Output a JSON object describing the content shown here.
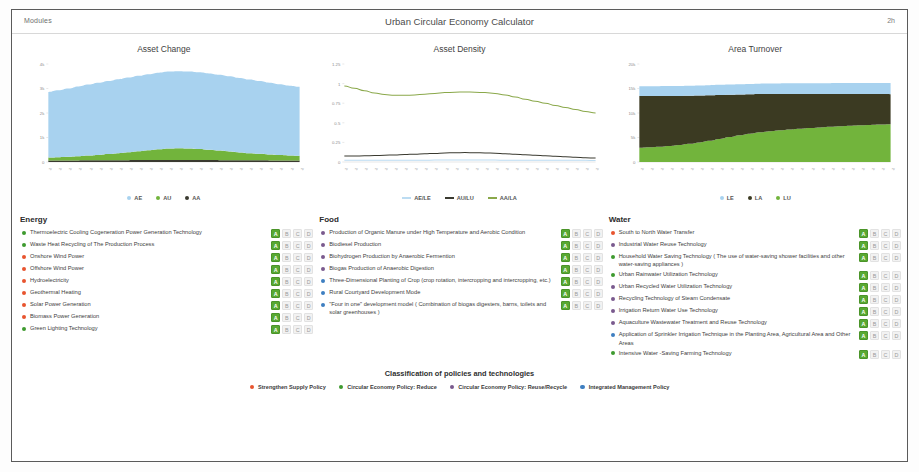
{
  "header": {
    "modules_label": "Modules",
    "app_title": "Urban Circular Economy Calculator",
    "clock": "2h"
  },
  "colors": {
    "supply_policy": "#e8542f",
    "reduce_policy": "#3e9a2f",
    "reuse_recycle_policy": "#7a5a8e",
    "integrated_policy": "#3e7fc1",
    "grade_active": "#58a832",
    "grade_inactive": "#f2f2f2",
    "area_blue": "#a8d2ef",
    "area_green": "#72b43c",
    "area_dark": "#3b3a22",
    "line_olive": "#8aa84a",
    "line_dark": "#3a3a30",
    "line_blue": "#bcdcf2"
  },
  "chart_data": [
    {
      "type": "area",
      "title": "Asset Change",
      "xlabel": "",
      "ylabel": "",
      "ylim": [
        0,
        4000
      ],
      "yticks": [
        0,
        1000,
        2000,
        3000,
        4000
      ],
      "ytick_labels": [
        "0",
        "1k",
        "2k",
        "3k",
        "4k"
      ],
      "grid": false,
      "legend_position": "bottom",
      "stacked": true,
      "x": [
        "2010",
        "2011",
        "2012",
        "2013",
        "2014",
        "2015",
        "2016",
        "2017",
        "2018",
        "2019",
        "2020",
        "2021",
        "2022",
        "2023",
        "2024",
        "2025",
        "2026",
        "2027",
        "2028",
        "2029",
        "2030",
        "2031",
        "2032",
        "2033",
        "2034",
        "2035"
      ],
      "series": [
        {
          "name": "AA",
          "marker": "circle",
          "color": "#3a3a30",
          "values": [
            60,
            62,
            64,
            66,
            68,
            70,
            72,
            74,
            76,
            78,
            80,
            82,
            84,
            84,
            82,
            80,
            78,
            76,
            74,
            72,
            70,
            68,
            66,
            64,
            62,
            60
          ]
        },
        {
          "name": "AU",
          "marker": "circle",
          "color": "#72b43c",
          "values": [
            120,
            135,
            150,
            170,
            195,
            220,
            250,
            285,
            320,
            360,
            400,
            440,
            470,
            480,
            470,
            450,
            420,
            390,
            355,
            320,
            290,
            265,
            240,
            220,
            205,
            195
          ]
        },
        {
          "name": "AE",
          "marker": "circle",
          "color": "#a8d2ef",
          "values": [
            2680,
            2730,
            2790,
            2850,
            2900,
            2945,
            2985,
            3020,
            3050,
            3080,
            3105,
            3125,
            3140,
            3145,
            3140,
            3130,
            3115,
            3095,
            3070,
            3040,
            3005,
            2970,
            2930,
            2890,
            2850,
            2815
          ]
        }
      ]
    },
    {
      "type": "line",
      "title": "Asset Density",
      "xlabel": "",
      "ylabel": "",
      "ylim": [
        0,
        1.25
      ],
      "yticks": [
        0,
        0.25,
        0.5,
        0.75,
        1,
        1.25
      ],
      "ytick_labels": [
        "0",
        "0.25",
        "0.5",
        "0.75",
        "1",
        "1.25"
      ],
      "grid": false,
      "legend_position": "bottom",
      "x": [
        "2010",
        "2011",
        "2012",
        "2013",
        "2014",
        "2015",
        "2016",
        "2017",
        "2018",
        "2019",
        "2020",
        "2021",
        "2022",
        "2023",
        "2024",
        "2025",
        "2026",
        "2027",
        "2028",
        "2029",
        "2030",
        "2031",
        "2032",
        "2033",
        "2034",
        "2035"
      ],
      "series": [
        {
          "name": "AA/LA",
          "color": "#8aa84a",
          "values": [
            0.97,
            0.94,
            0.91,
            0.88,
            0.86,
            0.85,
            0.85,
            0.855,
            0.865,
            0.875,
            0.885,
            0.89,
            0.893,
            0.89,
            0.885,
            0.875,
            0.855,
            0.83,
            0.8,
            0.775,
            0.75,
            0.72,
            0.695,
            0.67,
            0.645,
            0.625
          ]
        },
        {
          "name": "AU/LU",
          "color": "#3a3a30",
          "values": [
            0.075,
            0.077,
            0.079,
            0.082,
            0.086,
            0.09,
            0.095,
            0.1,
            0.105,
            0.11,
            0.115,
            0.118,
            0.12,
            0.119,
            0.116,
            0.112,
            0.106,
            0.1,
            0.093,
            0.086,
            0.079,
            0.072,
            0.066,
            0.06,
            0.055,
            0.05
          ]
        },
        {
          "name": "AE/LE",
          "color": "#bcdcf2",
          "values": [
            0.021,
            0.021,
            0.021,
            0.022,
            0.022,
            0.022,
            0.023,
            0.023,
            0.023,
            0.024,
            0.024,
            0.024,
            0.024,
            0.024,
            0.024,
            0.024,
            0.023,
            0.023,
            0.023,
            0.022,
            0.022,
            0.022,
            0.021,
            0.021,
            0.021,
            0.02
          ]
        }
      ]
    },
    {
      "type": "area",
      "title": "Area Turnover",
      "xlabel": "",
      "ylabel": "",
      "ylim": [
        0,
        20000
      ],
      "yticks": [
        0,
        5000,
        10000,
        15000,
        20000
      ],
      "ytick_labels": [
        "0",
        "5k",
        "10k",
        "15k",
        "20k"
      ],
      "grid": false,
      "legend_position": "bottom",
      "stacked": true,
      "x": [
        "2010",
        "2011",
        "2012",
        "2013",
        "2014",
        "2015",
        "2016",
        "2017",
        "2018",
        "2019",
        "2020",
        "2021",
        "2022",
        "2023",
        "2024",
        "2025",
        "2026",
        "2027",
        "2028",
        "2029",
        "2030",
        "2031",
        "2032",
        "2033",
        "2034",
        "2035"
      ],
      "series": [
        {
          "name": "LU",
          "marker": "circle",
          "color": "#72b43c",
          "values": [
            2900,
            3000,
            3120,
            3280,
            3480,
            3720,
            4000,
            4330,
            4700,
            5080,
            5450,
            5780,
            6060,
            6290,
            6480,
            6640,
            6790,
            6930,
            7060,
            7180,
            7290,
            7390,
            7480,
            7560,
            7630,
            7700
          ]
        },
        {
          "name": "LA",
          "marker": "circle",
          "color": "#3b3a22",
          "values": [
            10550,
            10450,
            10330,
            10180,
            10000,
            9790,
            9550,
            9270,
            8960,
            8640,
            8330,
            8050,
            7810,
            7600,
            7420,
            7260,
            7110,
            6970,
            6840,
            6720,
            6610,
            6500,
            6400,
            6310,
            6230,
            6150
          ]
        },
        {
          "name": "LE",
          "marker": "circle",
          "color": "#a8d2ef",
          "values": [
            2000,
            2010,
            2020,
            2030,
            2040,
            2050,
            2060,
            2070,
            2080,
            2090,
            2100,
            2110,
            2120,
            2130,
            2140,
            2150,
            2160,
            2170,
            2180,
            2190,
            2200,
            2210,
            2220,
            2230,
            2240,
            2250
          ]
        }
      ]
    }
  ],
  "categories": [
    {
      "title": "Energy",
      "items": [
        {
          "bullet": "reduce_policy",
          "label": "Thermoelectric Cooling Cogeneration Power Generation Technology",
          "grades": [
            "A",
            "B",
            "C",
            "D"
          ],
          "active": "A"
        },
        {
          "bullet": "reduce_policy",
          "label": "Waste Heat Recycling of The Production Process",
          "grades": [
            "A",
            "B",
            "C",
            "D"
          ],
          "active": "A"
        },
        {
          "bullet": "supply_policy",
          "label": "Onshore Wind Power",
          "grades": [
            "A",
            "B",
            "C",
            "D"
          ],
          "active": "A"
        },
        {
          "bullet": "supply_policy",
          "label": "Offshore Wind Power",
          "grades": [
            "A",
            "B",
            "C",
            "D"
          ],
          "active": "A"
        },
        {
          "bullet": "supply_policy",
          "label": "Hydroelectricity",
          "grades": [
            "A",
            "B",
            "C",
            "D"
          ],
          "active": "A"
        },
        {
          "bullet": "supply_policy",
          "label": "Geothermal Heating",
          "grades": [
            "A",
            "B",
            "C",
            "D"
          ],
          "active": "A"
        },
        {
          "bullet": "supply_policy",
          "label": "Solar Power Generation",
          "grades": [
            "A",
            "B",
            "C",
            "D"
          ],
          "active": "A"
        },
        {
          "bullet": "supply_policy",
          "label": "Biomass Power Generation",
          "grades": [
            "A",
            "B",
            "C",
            "D"
          ],
          "active": "A"
        },
        {
          "bullet": "reduce_policy",
          "label": "Green Lighting Technology",
          "grades": [
            "A",
            "B",
            "C",
            "D"
          ],
          "active": "A"
        }
      ]
    },
    {
      "title": "Food",
      "items": [
        {
          "bullet": "reuse_recycle_policy",
          "label": "Production of Organic Manure under High Temperature and Aerobic Condition",
          "grades": [
            "A",
            "B",
            "C",
            "D"
          ],
          "active": "A"
        },
        {
          "bullet": "reuse_recycle_policy",
          "label": "Biodiesel Production",
          "grades": [
            "A",
            "B",
            "C",
            "D"
          ],
          "active": "A"
        },
        {
          "bullet": "reuse_recycle_policy",
          "label": "Biohydrogen Production by Anaerobic Fermention",
          "grades": [
            "A",
            "B",
            "C",
            "D"
          ],
          "active": "A"
        },
        {
          "bullet": "reuse_recycle_policy",
          "label": "Biogas Production of Anaerobic Digestion",
          "grades": [
            "A",
            "B",
            "C",
            "D"
          ],
          "active": "A"
        },
        {
          "bullet": "integrated_policy",
          "label": "Three-Dimensional Planting of Crop (crop rotation, intercropping and intercropping, etc.)",
          "grades": [
            "A",
            "B",
            "C",
            "D"
          ],
          "active": "A"
        },
        {
          "bullet": "integrated_policy",
          "label": "Rural Courtyard Development Mode",
          "grades": [
            "A",
            "B",
            "C",
            "D"
          ],
          "active": "A"
        },
        {
          "bullet": "integrated_policy",
          "label": "\"Four in one\" development model ( Combination of biogas digesters, barns, toilets and solar greenhouses )",
          "grades": [
            "A",
            "B",
            "C",
            "D"
          ],
          "active": "A"
        }
      ]
    },
    {
      "title": "Water",
      "items": [
        {
          "bullet": "supply_policy",
          "label": "South to North Water Transfer",
          "grades": [
            "A",
            "B",
            "C",
            "D"
          ],
          "active": "A"
        },
        {
          "bullet": "reuse_recycle_policy",
          "label": "Industrial Water Reuse Technology",
          "grades": [
            "A",
            "B",
            "C",
            "D"
          ],
          "active": "A"
        },
        {
          "bullet": "reduce_policy",
          "label": "Household Water Saving Technology ( The use of water-saving shower facilities and other water-saving appliances )",
          "grades": [
            "A",
            "B",
            "C",
            "D"
          ],
          "active": "A"
        },
        {
          "bullet": "reduce_policy",
          "label": "Urban Rainwater Utilization Technology",
          "grades": [
            "A",
            "B",
            "C",
            "D"
          ],
          "active": "A"
        },
        {
          "bullet": "reuse_recycle_policy",
          "label": "Urban Recycled Water Utilization Technology",
          "grades": [
            "A",
            "B",
            "C",
            "D"
          ],
          "active": "A"
        },
        {
          "bullet": "reuse_recycle_policy",
          "label": "Recycling Technology of Steam Condensate",
          "grades": [
            "A",
            "B",
            "C",
            "D"
          ],
          "active": "A"
        },
        {
          "bullet": "reuse_recycle_policy",
          "label": "Irrigation Return Water Use Technology",
          "grades": [
            "A",
            "B",
            "C",
            "D"
          ],
          "active": "A"
        },
        {
          "bullet": "reuse_recycle_policy",
          "label": "Aquaculture Wastewater Treatment and Reuse Technology",
          "grades": [
            "A",
            "B",
            "C",
            "D"
          ],
          "active": "A"
        },
        {
          "bullet": "integrated_policy",
          "label": "Application of Sprinkler Irrigation Technique in the Planting Area, Agricultural Area and Other Areas",
          "grades": [
            "A",
            "B",
            "C",
            "D"
          ],
          "active": "A"
        },
        {
          "bullet": "reduce_policy",
          "label": "Intensive Water -Saving Farming Technology",
          "grades": [
            "A",
            "B",
            "C",
            "D"
          ],
          "active": "A"
        }
      ]
    }
  ],
  "footer": {
    "title": "Classification of policies and technologies",
    "legend": [
      {
        "label": "Strengthen Supply Policy",
        "color_key": "supply_policy"
      },
      {
        "label": "Circular Economy Policy: Reduce",
        "color_key": "reduce_policy"
      },
      {
        "label": "Circular Economy Policy: Reuse/Recycle",
        "color_key": "reuse_recycle_policy"
      },
      {
        "label": "Integrated Management Policy",
        "color_key": "integrated_policy"
      }
    ]
  }
}
